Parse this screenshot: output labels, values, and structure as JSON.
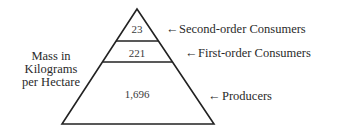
{
  "diagram": {
    "type": "pyramid",
    "axis_label": [
      "Mass in",
      "Kilograms",
      "per Hectare"
    ],
    "levels": [
      {
        "name": "Second-order Consumers",
        "value": "23",
        "arrow": "←"
      },
      {
        "name": "First-order Consumers",
        "value": "221",
        "arrow": "←"
      },
      {
        "name": "Producers",
        "value": "1,696",
        "arrow": "←"
      }
    ],
    "colors": {
      "line": "#222222",
      "background": "#ffffff"
    }
  }
}
